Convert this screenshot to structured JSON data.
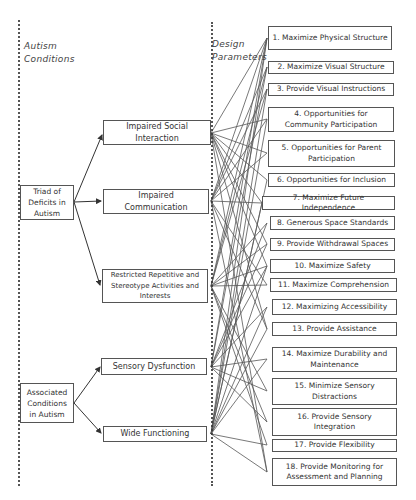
{
  "headings": {
    "left": [
      "Autism",
      "Conditions"
    ],
    "right": [
      "Design",
      "Parameters"
    ]
  },
  "roots": [
    {
      "id": "triad",
      "label": "Triad of Deficits in Autism"
    },
    {
      "id": "assoc",
      "label": "Associated Conditions in Autism"
    }
  ],
  "conditions": [
    {
      "id": "social",
      "label": "Impaired Social Interaction"
    },
    {
      "id": "comm",
      "label": "Impaired Communication"
    },
    {
      "id": "restricted",
      "label": "Restricted Repetitive and Stereotype Activities and Interests"
    },
    {
      "id": "sensory",
      "label": "Sensory Dysfunction"
    },
    {
      "id": "wide",
      "label": "Wide Functioning"
    }
  ],
  "parameters": [
    {
      "n": 1,
      "label": "1. Maximize Physical Structure"
    },
    {
      "n": 2,
      "label": "2. Maximize Visual Structure"
    },
    {
      "n": 3,
      "label": "3. Provide Visual Instructions"
    },
    {
      "n": 4,
      "label": "4. Opportunities for Community Participation"
    },
    {
      "n": 5,
      "label": "5. Opportunities for Parent Participation"
    },
    {
      "n": 6,
      "label": "6. Opportunities for Inclusion"
    },
    {
      "n": 7,
      "label": "7. Maximize Future Independence"
    },
    {
      "n": 8,
      "label": "8. Generous Space Standards"
    },
    {
      "n": 9,
      "label": "9. Provide Withdrawal Spaces"
    },
    {
      "n": 10,
      "label": "10. Maximize Safety"
    },
    {
      "n": 11,
      "label": "11. Maximize Comprehension"
    },
    {
      "n": 12,
      "label": "12. Maximizing Accessibility"
    },
    {
      "n": 13,
      "label": "13. Provide Assistance"
    },
    {
      "n": 14,
      "label": "14. Maximize Durability and Maintenance"
    },
    {
      "n": 15,
      "label": "15. Minimize Sensory Distractions"
    },
    {
      "n": 16,
      "label": "16. Provide Sensory Integration"
    },
    {
      "n": 17,
      "label": "17. Provide Flexibility"
    },
    {
      "n": 18,
      "label": "18. Provide Monitoring for Assessment and Planning"
    }
  ],
  "colors": {
    "line": "#3a3a3a",
    "border": "#555555",
    "background": "#ffffff"
  }
}
